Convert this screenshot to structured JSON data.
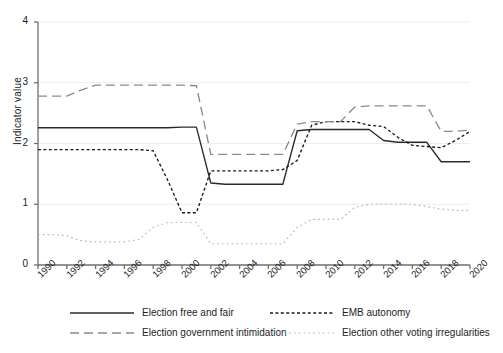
{
  "chart_data": {
    "type": "line",
    "title": "",
    "xlabel": "",
    "ylabel": "Indicator value",
    "xlim": [
      1990,
      2020
    ],
    "ylim": [
      0,
      4
    ],
    "yticks": [
      0,
      1,
      2,
      3,
      4
    ],
    "xticks": [
      1990,
      1992,
      1994,
      1996,
      1998,
      2000,
      2002,
      2004,
      2006,
      2008,
      2010,
      2012,
      2014,
      2016,
      2018,
      2020
    ],
    "grid": "horizontal-light",
    "legend_position": "bottom",
    "x": [
      1990,
      1991,
      1992,
      1993,
      1994,
      1995,
      1996,
      1997,
      1998,
      1999,
      2000,
      2001,
      2002,
      2003,
      2004,
      2005,
      2006,
      2007,
      2008,
      2009,
      2010,
      2011,
      2012,
      2013,
      2014,
      2015,
      2016,
      2017,
      2018,
      2019,
      2020
    ],
    "series": [
      {
        "name": "Election free and fair",
        "style": "solid",
        "color": "#2a2a2a",
        "values": [
          2.26,
          2.26,
          2.26,
          2.26,
          2.26,
          2.26,
          2.26,
          2.26,
          2.26,
          2.26,
          2.27,
          2.27,
          1.35,
          1.33,
          1.33,
          1.33,
          1.33,
          1.33,
          2.21,
          2.23,
          2.23,
          2.23,
          2.23,
          2.23,
          2.05,
          2.02,
          2.02,
          2.02,
          1.7,
          1.7,
          1.7
        ]
      },
      {
        "name": "EMB autonomy",
        "style": "dashed-dense",
        "color": "#1a1a1a",
        "values": [
          1.9,
          1.9,
          1.9,
          1.9,
          1.9,
          1.9,
          1.9,
          1.9,
          1.88,
          1.4,
          0.86,
          0.86,
          1.55,
          1.55,
          1.55,
          1.55,
          1.55,
          1.57,
          1.72,
          2.3,
          2.36,
          2.36,
          2.36,
          2.3,
          2.28,
          2.1,
          1.97,
          1.95,
          1.93,
          2.05,
          2.2
        ]
      },
      {
        "name": "Election government intimidation",
        "style": "dashed-long",
        "color": "#8a8a8a",
        "values": [
          2.78,
          2.78,
          2.78,
          2.88,
          2.96,
          2.96,
          2.96,
          2.96,
          2.96,
          2.96,
          2.96,
          2.95,
          1.82,
          1.82,
          1.82,
          1.82,
          1.82,
          1.82,
          2.32,
          2.36,
          2.36,
          2.36,
          2.6,
          2.62,
          2.62,
          2.62,
          2.62,
          2.62,
          2.2,
          2.2,
          2.22
        ]
      },
      {
        "name": "Election other voting irregularities",
        "style": "dotted-sparse",
        "color": "#b5b5b5",
        "values": [
          0.5,
          0.5,
          0.48,
          0.4,
          0.38,
          0.38,
          0.38,
          0.42,
          0.62,
          0.7,
          0.7,
          0.7,
          0.35,
          0.35,
          0.35,
          0.35,
          0.35,
          0.35,
          0.62,
          0.75,
          0.75,
          0.75,
          0.95,
          1.0,
          1.0,
          1.0,
          1.0,
          0.96,
          0.92,
          0.9,
          0.9
        ]
      }
    ]
  },
  "legend": {
    "items": [
      {
        "label": "Election free and fair",
        "style": "solid",
        "color": "#2a2a2a"
      },
      {
        "label": "EMB autonomy",
        "style": "dashed-dense",
        "color": "#1a1a1a"
      },
      {
        "label": "Election government intimidation",
        "style": "dashed-long",
        "color": "#8a8a8a"
      },
      {
        "label": "Election other voting irregularities",
        "style": "dotted-sparse",
        "color": "#b5b5b5"
      }
    ]
  }
}
